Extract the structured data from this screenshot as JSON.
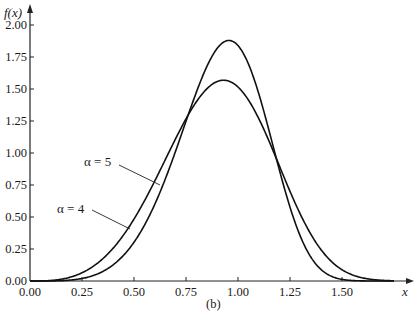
{
  "chart_data": {
    "type": "line",
    "title": "",
    "caption": "(b)",
    "xlabel": "x",
    "ylabel": "f(x)",
    "xlim": [
      0,
      1.75
    ],
    "ylim": [
      0,
      2.0
    ],
    "x_ticks": [
      "0.00",
      "0.25",
      "0.50",
      "0.75",
      "1.00",
      "1.25",
      "1.50"
    ],
    "y_ticks": [
      "0.00",
      "0.25",
      "0.50",
      "0.75",
      "1.00",
      "1.25",
      "1.50",
      "1.75",
      "2.00"
    ],
    "grid": false,
    "legend": "inline annotations with leader lines",
    "x": [
      0.0,
      0.1,
      0.2,
      0.3,
      0.4,
      0.5,
      0.6,
      0.7,
      0.8,
      0.9,
      0.95,
      1.0,
      1.1,
      1.2,
      1.3,
      1.4,
      1.5,
      1.6,
      1.7
    ],
    "series": [
      {
        "name": "α = 5",
        "label": "α = 5",
        "alpha": 5,
        "values": [
          0.0,
          0.0005,
          0.008,
          0.04,
          0.127,
          0.303,
          0.597,
          1.0,
          1.41,
          1.71,
          1.97,
          1.84,
          1.31,
          0.64,
          0.18,
          0.025,
          0.001,
          0.0,
          0.0
        ]
      },
      {
        "name": "α = 4",
        "label": "α = 4",
        "alpha": 4,
        "values": [
          0.0,
          0.004,
          0.032,
          0.107,
          0.249,
          0.47,
          0.76,
          1.09,
          1.39,
          1.52,
          1.57,
          1.47,
          1.23,
          0.87,
          0.5,
          0.22,
          0.08,
          0.02,
          0.003
        ]
      }
    ]
  },
  "labels": {
    "ylabel": "f(x)",
    "xlabel": "x",
    "caption": "(b)",
    "alpha5": "α = 5",
    "alpha4": "α = 4"
  }
}
